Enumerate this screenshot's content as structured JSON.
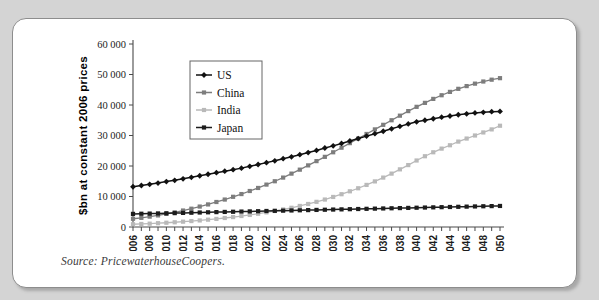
{
  "figure": {
    "source_note": "Source: PricewaterhouseCoopers."
  },
  "chart_data": {
    "type": "line",
    "title": "",
    "xlabel": "",
    "ylabel": "$bn at constant 2006 prices",
    "xlim": [
      2006,
      2050
    ],
    "ylim": [
      0,
      60000
    ],
    "ytick_labels": [
      "0",
      "10 000",
      "20 000",
      "30 000",
      "40 000",
      "50 000",
      "60 000"
    ],
    "ytick_values": [
      0,
      10000,
      20000,
      30000,
      40000,
      50000,
      60000
    ],
    "grid": false,
    "legend_position": "top-left",
    "x": [
      2006,
      2007,
      2008,
      2009,
      2010,
      2011,
      2012,
      2013,
      2014,
      2015,
      2016,
      2017,
      2018,
      2019,
      2020,
      2021,
      2022,
      2023,
      2024,
      2025,
      2026,
      2027,
      2028,
      2029,
      2030,
      2031,
      2032,
      2033,
      2034,
      2035,
      2036,
      2037,
      2038,
      2039,
      2040,
      2041,
      2042,
      2043,
      2044,
      2045,
      2046,
      2047,
      2048,
      2049,
      2050
    ],
    "xtick_labels": [
      "2006",
      "2008",
      "2010",
      "2012",
      "2014",
      "2016",
      "2018",
      "2020",
      "2022",
      "2024",
      "2026",
      "2028",
      "2030",
      "2032",
      "2034",
      "2036",
      "2038",
      "2040",
      "2042",
      "2044",
      "2046",
      "2048",
      "2050"
    ],
    "series": [
      {
        "name": "US",
        "color": "#111111",
        "marker": "diamond",
        "values": [
          13200,
          13600,
          14000,
          14400,
          14900,
          15300,
          15800,
          16300,
          16800,
          17300,
          17800,
          18300,
          18800,
          19300,
          19900,
          20500,
          21100,
          21700,
          22400,
          23000,
          23700,
          24400,
          25100,
          25900,
          26600,
          27400,
          28200,
          29000,
          29800,
          30600,
          31400,
          32200,
          33000,
          33800,
          34500,
          35000,
          35500,
          36000,
          36400,
          36800,
          37100,
          37400,
          37600,
          37800,
          37900
        ]
      },
      {
        "name": "China",
        "color": "#7d7d7d",
        "marker": "square",
        "values": [
          2700,
          3000,
          3400,
          3800,
          4300,
          4800,
          5400,
          6000,
          6700,
          7400,
          8200,
          9000,
          9900,
          10800,
          11800,
          12800,
          13900,
          15000,
          16200,
          17500,
          18800,
          20200,
          21600,
          23000,
          24500,
          26000,
          27500,
          29000,
          30500,
          32000,
          33500,
          35000,
          36500,
          38000,
          39400,
          40700,
          42000,
          43200,
          44300,
          45300,
          46200,
          47000,
          47700,
          48300,
          48800
        ]
      },
      {
        "name": "India",
        "color": "#b9b9b9",
        "marker": "square",
        "values": [
          900,
          1000,
          1100,
          1250,
          1400,
          1550,
          1750,
          1950,
          2150,
          2400,
          2650,
          2950,
          3250,
          3600,
          3950,
          4350,
          4800,
          5250,
          5750,
          6300,
          6900,
          7550,
          8250,
          9000,
          9850,
          10750,
          11700,
          12700,
          13800,
          14950,
          16200,
          17500,
          18900,
          20300,
          21800,
          23200,
          24500,
          25700,
          26800,
          28000,
          29000,
          30000,
          31000,
          32000,
          33200
        ]
      },
      {
        "name": "Japan",
        "color": "#1c1c1c",
        "marker": "square",
        "values": [
          4300,
          4350,
          4400,
          4450,
          4500,
          4550,
          4620,
          4680,
          4750,
          4820,
          4880,
          4940,
          5000,
          5060,
          5120,
          5180,
          5250,
          5300,
          5360,
          5420,
          5480,
          5540,
          5600,
          5660,
          5720,
          5780,
          5840,
          5900,
          5960,
          6020,
          6080,
          6140,
          6200,
          6260,
          6320,
          6380,
          6440,
          6500,
          6560,
          6620,
          6680,
          6740,
          6800,
          6850,
          6900
        ]
      }
    ]
  }
}
